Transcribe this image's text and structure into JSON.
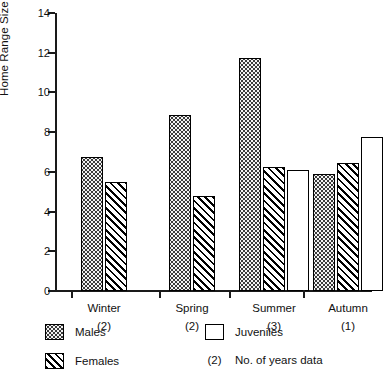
{
  "chart_data": {
    "type": "bar",
    "title": "",
    "xlabel": "",
    "ylabel": "Home Range Size (ha)",
    "ylim": [
      0,
      14
    ],
    "ytick_labels": [
      "0",
      "2",
      "4",
      "6",
      "8",
      "10",
      "12",
      "14"
    ],
    "ytick_values": [
      0,
      2,
      4,
      6,
      8,
      10,
      12,
      14
    ],
    "grid": false,
    "legend_position": "below-axes",
    "categories": [
      "Winter",
      "Spring",
      "Summer",
      "Autumn"
    ],
    "category_notes": [
      "(2)",
      "(2)",
      "(3)",
      "(1)"
    ],
    "series": [
      {
        "name": "Males",
        "values": [
          6.75,
          8.85,
          11.75,
          5.9
        ]
      },
      {
        "name": "Females",
        "values": [
          5.5,
          4.8,
          6.25,
          6.45
        ]
      },
      {
        "name": "Juveniles",
        "values": [
          null,
          null,
          6.1,
          7.75
        ]
      }
    ]
  },
  "axis": {
    "y_title": "Home Range Size (ha)",
    "ticks": [
      {
        "label": "14",
        "value": 14
      },
      {
        "label": "12",
        "value": 12
      },
      {
        "label": "10",
        "value": 10
      },
      {
        "label": "8",
        "value": 8
      },
      {
        "label": "6",
        "value": 6
      },
      {
        "label": "4",
        "value": 4
      },
      {
        "label": "2",
        "value": 2
      },
      {
        "label": "0",
        "value": 0
      }
    ]
  },
  "groups": [
    {
      "label": "Winter",
      "note": "(2)"
    },
    {
      "label": "Spring",
      "note": "(2)"
    },
    {
      "label": "Summer",
      "note": "(3)"
    },
    {
      "label": "Autumn",
      "note": "(1)"
    }
  ],
  "legend": {
    "males_label": "Males",
    "females_label": "Females",
    "juveniles_label": "Juveniles",
    "years_key": "(2)",
    "years_label": "No. of years data"
  },
  "colors": {
    "ink": "#000000",
    "males_fill": "#f2f2f2",
    "females_fill": "#ffffff",
    "juveniles_fill": "#ffffff",
    "background": "#ffffff"
  }
}
